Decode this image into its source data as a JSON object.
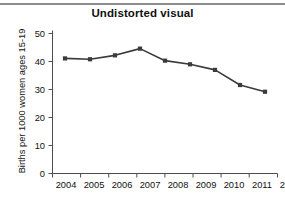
{
  "figure": {
    "title": "Undistorted visual",
    "top_rule_color": "#8c8c8c",
    "background": "#ffffff"
  },
  "chart_data": {
    "type": "line",
    "title": "Undistorted visual",
    "xlabel": "",
    "ylabel": "Births per 1000 women ages 15-19",
    "categories": [
      "2004",
      "2005",
      "2006",
      "2007",
      "2008",
      "2009",
      "2010",
      "2011",
      "2012"
    ],
    "values": [
      41.1,
      40.8,
      42.2,
      44.6,
      40.3,
      39.0,
      37.0,
      31.6,
      29.2
    ],
    "ylim": [
      0,
      50
    ],
    "yticks": [
      "0",
      "10",
      "20",
      "30",
      "40",
      "50"
    ],
    "xticks": [
      "2004",
      "2005",
      "2006",
      "2007",
      "2008",
      "2009",
      "2010",
      "2011",
      "2012"
    ],
    "grid": false,
    "legend": false,
    "series_color": "#3b3b3b",
    "marker": "square"
  }
}
